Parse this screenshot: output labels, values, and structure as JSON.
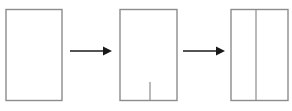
{
  "diagram": {
    "type": "process-sequence",
    "canvas": {
      "width": 292,
      "height": 111,
      "background": "#ffffff"
    },
    "style": {
      "shape_stroke": "#8c8c8c",
      "shape_fill": "#ffffff",
      "shape_stroke_width": 1.4,
      "inner_line_stroke": "#8c8c8c",
      "inner_line_width": 1.2,
      "arrow_color": "#1a1a1a",
      "arrow_shaft_width": 1.6
    },
    "steps": [
      {
        "id": "step-1",
        "label": "plain-rectangle",
        "description": "Empty upright rectangle",
        "shape": "rectangle",
        "x": 6,
        "y": 9.5,
        "width": 56,
        "height": 91,
        "inner_lines": []
      },
      {
        "id": "step-2",
        "label": "rectangle-with-bottom-notch",
        "description": "Rectangle with a short vertical line rising from the bottom edge",
        "shape": "rectangle",
        "x": 120,
        "y": 9.5,
        "width": 57,
        "height": 91,
        "inner_lines": [
          {
            "id": "notch-line",
            "label": "bottom-notch",
            "orientation": "vertical",
            "x": 150,
            "y1": 82,
            "y2": 100.5
          }
        ]
      },
      {
        "id": "step-3",
        "label": "rectangle-split-in-two",
        "description": "Rectangle divided by a full-height vertical line into two panels",
        "shape": "rectangle",
        "x": 231,
        "y": 9.5,
        "width": 57,
        "height": 91,
        "inner_lines": [
          {
            "id": "divider-line",
            "label": "full-height-divider",
            "orientation": "vertical",
            "x": 256,
            "y1": 9.5,
            "y2": 100.5
          }
        ]
      }
    ],
    "arrows": [
      {
        "id": "arrow-1",
        "label": "arrow-step1-to-step2",
        "direction": "right",
        "x1": 70,
        "x2": 112,
        "y": 51,
        "head_length": 9,
        "head_half_height": 4.5
      },
      {
        "id": "arrow-2",
        "label": "arrow-step2-to-step3",
        "direction": "right",
        "x1": 183,
        "x2": 225,
        "y": 51,
        "head_length": 9,
        "head_half_height": 4.5
      }
    ]
  }
}
